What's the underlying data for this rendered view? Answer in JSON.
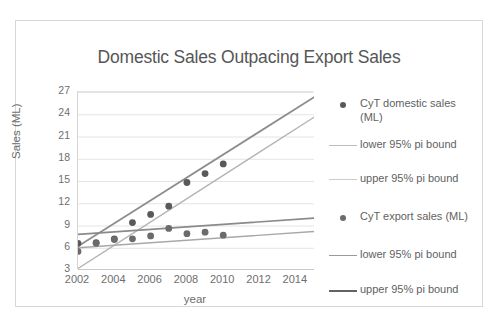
{
  "chart_data": {
    "type": "scatter",
    "title": "Domestic Sales Outpacing Export Sales",
    "xlabel": "year",
    "ylabel": "Sales (ML)",
    "xlim": [
      2002,
      2015
    ],
    "ylim": [
      3,
      27
    ],
    "xticks": [
      2002,
      2004,
      2006,
      2008,
      2010,
      2012,
      2014
    ],
    "yticks": [
      3,
      6,
      9,
      12,
      15,
      18,
      21,
      24,
      27
    ],
    "grid": "horizontal",
    "legend_position": "right",
    "x": [
      2002,
      2003,
      2004,
      2005,
      2006,
      2007,
      2008,
      2009,
      2010
    ],
    "series": [
      {
        "name": "CyT domestic sales (ML)",
        "kind": "markers",
        "color": "#595959",
        "values": [
          6.6,
          6.7,
          7.2,
          9.4,
          10.5,
          11.6,
          14.8,
          16.0,
          17.3
        ]
      },
      {
        "name": "CyT export sales (ML)",
        "kind": "markers",
        "color": "#6b6b6b",
        "values": [
          5.5,
          6.6,
          7.1,
          7.2,
          7.6,
          8.6,
          7.9,
          8.1,
          7.7
        ]
      }
    ],
    "bands": [
      {
        "name": "domestic lower 95% pi bound",
        "color": "#b4b4b4",
        "width": 1.4,
        "x": [
          2002,
          2015
        ],
        "y": [
          3.2,
          23.6
        ]
      },
      {
        "name": "domestic upper 95% pi bound",
        "color": "#8d8d8d",
        "width": 1.8,
        "x": [
          2002,
          2015
        ],
        "y": [
          6.2,
          26.3
        ]
      },
      {
        "name": "export lower 95% pi bound",
        "color": "#a8a8a8",
        "width": 1.4,
        "x": [
          2002,
          2015
        ],
        "y": [
          6.0,
          8.2
        ]
      },
      {
        "name": "export upper 95% pi bound",
        "color": "#8a8a8a",
        "width": 1.6,
        "x": [
          2002,
          2015
        ],
        "y": [
          7.8,
          10.0
        ]
      }
    ],
    "legend": [
      {
        "label": "CyT domestic sales\n(ML)",
        "marker": "dot",
        "color": "#595959"
      },
      {
        "label": "lower 95% pi bound",
        "marker": "line",
        "color": "#bdbdbd",
        "width": 1.4
      },
      {
        "label": "upper 95% pi bound",
        "marker": "line",
        "color": "#cccccc",
        "width": 1.4
      },
      {
        "label": "CyT export sales (ML)",
        "marker": "dot",
        "color": "#6b6b6b"
      },
      {
        "label": "lower 95% pi bound",
        "marker": "line",
        "color": "#9a9a9a",
        "width": 1.6
      },
      {
        "label": "upper 95% pi bound",
        "marker": "line",
        "color": "#636363",
        "width": 2.2
      }
    ]
  }
}
